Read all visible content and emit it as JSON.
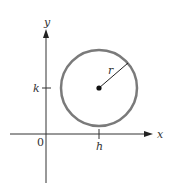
{
  "diagram": {
    "axes": {
      "x_label": "x",
      "y_label": "y",
      "origin_label": "0"
    },
    "ticks": {
      "x_tick_label": "h",
      "y_tick_label": "k"
    },
    "circle": {
      "radius_label": "r",
      "stroke_color": "#7a7a7a",
      "center_color": "#111111"
    },
    "colors": {
      "axis": "#333333",
      "background": "#ffffff"
    }
  }
}
